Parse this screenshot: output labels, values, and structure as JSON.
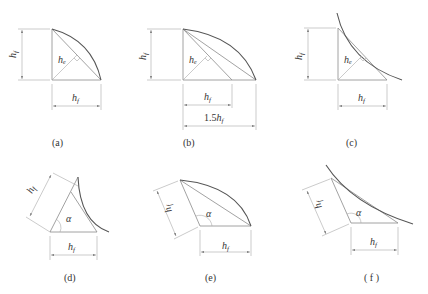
{
  "figure": {
    "panels": [
      {
        "id": "a",
        "caption": "(a)",
        "labels": {
          "height": "h",
          "height_sub": "f",
          "base": "h",
          "base_sub": "f",
          "throat": "h",
          "throat_sub": "e"
        }
      },
      {
        "id": "b",
        "caption": "(b)",
        "labels": {
          "height": "h",
          "height_sub": "f",
          "base": "h",
          "base_sub": "f",
          "throat": "h",
          "throat_sub": "e",
          "long_base_prefix": "1.5",
          "long_base": "h",
          "long_base_sub": "f"
        }
      },
      {
        "id": "c",
        "caption": "(c)",
        "labels": {
          "height": "h",
          "height_sub": "f",
          "base": "h",
          "base_sub": "f",
          "throat": "h",
          "throat_sub": "e"
        }
      },
      {
        "id": "d",
        "caption": "(d)",
        "labels": {
          "height": "h",
          "height_sub": "f",
          "base": "h",
          "base_sub": "f",
          "angle": "α"
        }
      },
      {
        "id": "e",
        "caption": "(e)",
        "labels": {
          "height": "h",
          "height_sub": "f",
          "base": "h",
          "base_sub": "f",
          "angle": "α"
        }
      },
      {
        "id": "f",
        "caption": "( f )",
        "labels": {
          "height": "h",
          "height_sub": "f",
          "base": "h",
          "base_sub": "f",
          "angle": "α"
        }
      }
    ],
    "colors": {
      "line": "#8a8a8a",
      "curve": "#555555",
      "text": "#333333",
      "background": "#ffffff"
    }
  }
}
